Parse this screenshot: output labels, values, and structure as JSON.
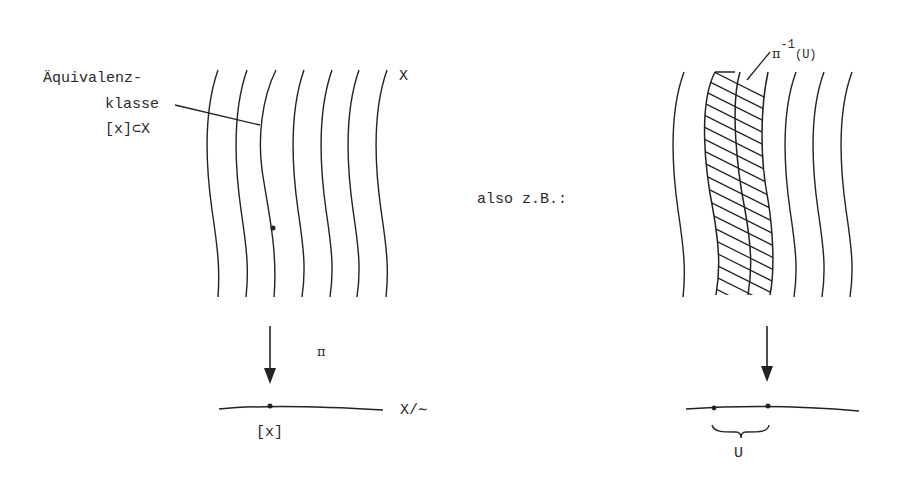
{
  "left": {
    "annotation": {
      "line1": "Äquivalenz-",
      "line2": "klasse",
      "line3": "[x]⊂X"
    },
    "space_label": "X",
    "map_label": "π",
    "quotient_label": "X/∼",
    "point_label": "[x]"
  },
  "middle": {
    "text": "also z.B.:"
  },
  "right": {
    "preimage_label_base": "π",
    "preimage_label_exp": "-1",
    "preimage_label_arg": "(U)",
    "open_set_label": "U"
  },
  "colors": {
    "ink": "#222222",
    "background": "#ffffff"
  }
}
